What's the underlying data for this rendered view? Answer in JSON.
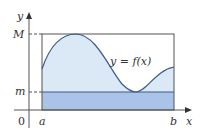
{
  "diagram": {
    "axis_labels": {
      "y": "y",
      "x": "x",
      "origin": "0"
    },
    "tick_labels": {
      "a": "a",
      "b": "b",
      "M": "M",
      "m": "m"
    },
    "curve_label": "y = f(x)",
    "colors": {
      "axis": "#555555",
      "curve": "#3b5a8a",
      "area_upper": "#dbe8f6",
      "area_lower": "#a9c4e6",
      "rect_outline": "#555555",
      "text": "#333333"
    }
  }
}
